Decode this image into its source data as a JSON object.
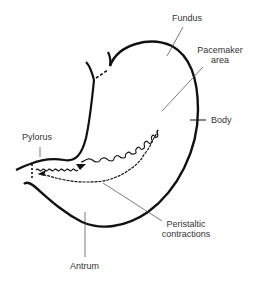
{
  "diagram": {
    "labels": {
      "fundus": "Fundus",
      "pacemaker_line1": "Pacemaker",
      "pacemaker_line2": "area",
      "body": "Body",
      "pylorus": "Pylorus",
      "peristaltic_line1": "Peristaltic",
      "peristaltic_line2": "contractions",
      "antrum": "Antrum"
    },
    "colors": {
      "outline": "#111111",
      "leader": "#444444",
      "text": "#333333",
      "background": "#ffffff"
    }
  }
}
